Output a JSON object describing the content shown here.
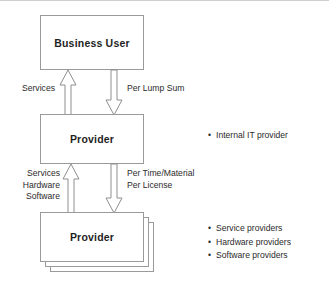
{
  "diagram": {
    "nodes": [
      {
        "id": "business-user",
        "label": "Business User"
      },
      {
        "id": "provider-internal",
        "label": "Provider"
      },
      {
        "id": "provider-external",
        "label": "Provider"
      }
    ],
    "edges": [
      {
        "id": "services-up",
        "label": "Services",
        "direction": "up",
        "from": "provider-internal",
        "to": "business-user"
      },
      {
        "id": "lump-sum-down",
        "label": "Per Lump Sum",
        "direction": "down",
        "from": "business-user",
        "to": "provider-internal"
      },
      {
        "id": "goods-up",
        "label": "Services\nHardware\nSoftware",
        "label_lines": [
          "Services",
          "Hardware",
          "Software"
        ],
        "direction": "up",
        "from": "provider-external",
        "to": "provider-internal"
      },
      {
        "id": "time-material-down",
        "label": "Per Time/Material\nPer License",
        "label_lines": [
          "Per Time/Material",
          "Per License"
        ],
        "direction": "down",
        "from": "provider-internal",
        "to": "provider-external"
      }
    ],
    "annotations": [
      {
        "id": "internal",
        "items": [
          "Internal IT provider"
        ]
      },
      {
        "id": "external",
        "items": [
          "Service providers",
          "Hardware providers",
          "Software providers"
        ]
      }
    ],
    "stack_count": 3,
    "colors": {
      "background": "#ffffff",
      "box_border": "#9a9a9a",
      "arrow_stroke": "#8f8f8f",
      "arrow_fill": "#ffffff",
      "text": "#2b2b2b",
      "heading_text": "#1f1f1f",
      "top_rule": "#cfcfcf"
    }
  }
}
